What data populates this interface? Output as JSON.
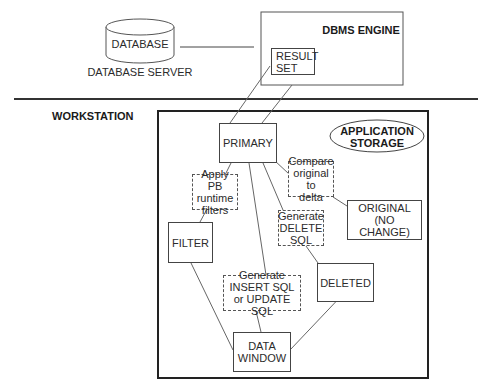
{
  "server": {
    "database_label": "DATABASE",
    "server_caption": "DATABASE SERVER",
    "engine_title": "DBMS ENGINE",
    "result_set": "RESULT\nSET"
  },
  "workstation": {
    "title": "WORKSTATION",
    "app_storage": "APPLICATION\nSTORAGE",
    "nodes": {
      "primary": "PRIMARY",
      "filter": "FILTER",
      "original": "ORIGINAL\n(NO CHANGE)",
      "deleted": "DELETED",
      "data_window": "DATA\nWINDOW"
    },
    "processes": {
      "apply_filters": "Apply PB\nruntime\nfilters",
      "compare": "Compare\noriginal to\ndelta",
      "generate_delete": "Generate\nDELETE\nSQL",
      "generate_insert_update": "Generate\nINSERT SQL\nor UPDATE SQL"
    }
  }
}
